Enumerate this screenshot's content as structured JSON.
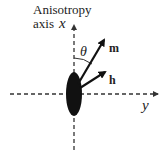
{
  "diagram": {
    "axis_caption_line1": "Anisotropy",
    "axis_caption_line2": "axis",
    "x_axis_label": "x",
    "y_axis_label": "y",
    "angle_label": "θ",
    "vector_m_label": "m",
    "vector_h_label": "h",
    "colors": {
      "ink": "#111111",
      "particle": "#111111"
    }
  }
}
